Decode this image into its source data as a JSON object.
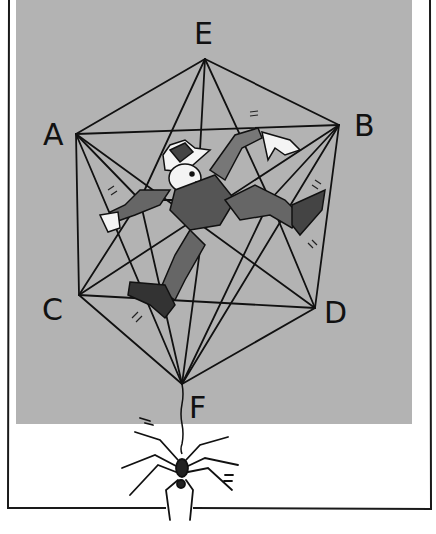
{
  "illustration": {
    "panel_color": "#b3b3b3",
    "line_color": "#111111",
    "vertices": {
      "E": {
        "label": "E",
        "x": 205,
        "y": 59
      },
      "A": {
        "label": "A",
        "x": 76,
        "y": 134
      },
      "B": {
        "label": "B",
        "x": 339,
        "y": 125
      },
      "C": {
        "label": "C",
        "x": 79,
        "y": 295
      },
      "D": {
        "label": "D",
        "x": 315,
        "y": 308
      },
      "F": {
        "label": "F",
        "x": 182,
        "y": 384
      }
    },
    "figure": "man-trapped-in-wireframe",
    "creature": "spider-hanging-from-thread"
  }
}
